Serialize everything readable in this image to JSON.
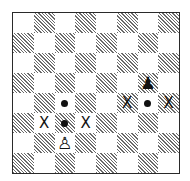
{
  "diagram": {
    "type": "chessboard",
    "files": [
      "a",
      "b",
      "c",
      "d",
      "e",
      "f",
      "g",
      "h"
    ],
    "ranks": [
      8,
      7,
      6,
      5,
      4,
      3,
      2,
      1
    ],
    "colors": {
      "light_square": "#ffffff",
      "dark_square_hatch": "#6a6a6a",
      "border": "#2a2a2a",
      "ink": "#111111"
    },
    "pieces": [
      {
        "square": "c2",
        "piece": "pawn",
        "color": "white",
        "glyph": "♙"
      },
      {
        "square": "g5",
        "piece": "pawn",
        "color": "black",
        "glyph": "♟"
      }
    ],
    "markers": [
      {
        "square": "c3",
        "type": "dot"
      },
      {
        "square": "c4",
        "type": "dot"
      },
      {
        "square": "b3",
        "type": "x",
        "label": "X"
      },
      {
        "square": "d3",
        "type": "x",
        "label": "X"
      },
      {
        "square": "g4",
        "type": "dot"
      },
      {
        "square": "f4",
        "type": "x",
        "label": "X"
      },
      {
        "square": "h4",
        "type": "x",
        "label": "X"
      }
    ]
  }
}
